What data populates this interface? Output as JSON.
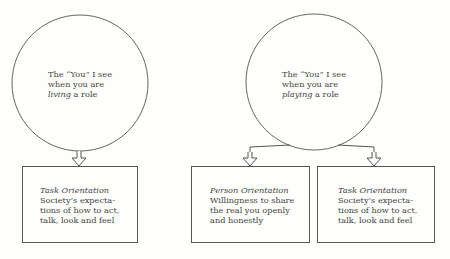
{
  "left_diagram": {
    "circle": {
      "line1": "The “You” I see",
      "line2": "when you are",
      "emphasis": "living",
      "line3_rest": " a role"
    },
    "box": {
      "title": "Task Orientation",
      "lines": [
        "Society’s expecta-",
        "tions of how to act,",
        "talk, look and feel"
      ]
    }
  },
  "right_diagram": {
    "circle": {
      "line1": "The “You” I see",
      "line2": "when you are",
      "emphasis": "playing",
      "line3_rest": " a role"
    },
    "boxes": [
      {
        "title": "Person Orientation",
        "lines": [
          "Willingness to share",
          "the real you openly",
          "and honestly"
        ]
      },
      {
        "title": "Task Orientation",
        "lines": [
          "Society’s expecta-",
          "tions of how to act,",
          "talk, look and feel"
        ]
      }
    ]
  },
  "colors": {
    "line": "#555555",
    "background": "#fefefc",
    "text": "#444444"
  }
}
